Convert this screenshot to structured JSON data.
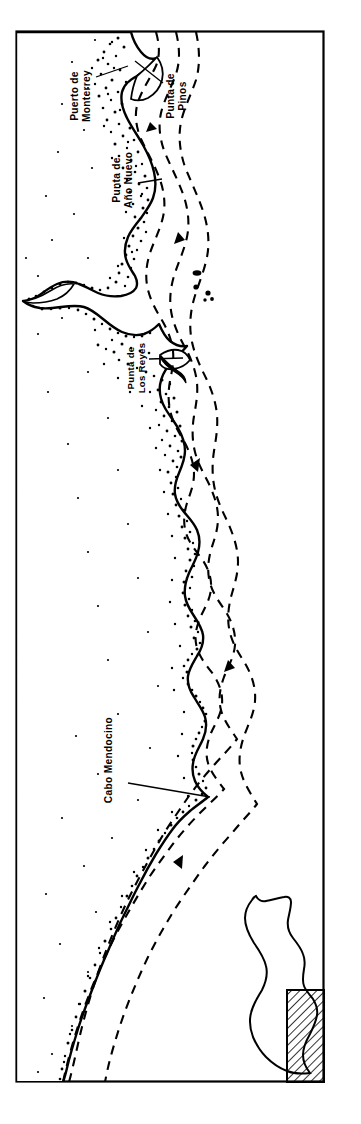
{
  "figure": {
    "type": "map",
    "title": "",
    "orientation": "rotated-90",
    "frame": {
      "visible": true,
      "stroke": "#000000",
      "x": 16,
      "y": 31,
      "width": 308,
      "height": 1051
    }
  },
  "labels": [
    {
      "id": "puerto-de-monterrey",
      "line1": "Puerto de",
      "line2": "Monterrey",
      "x": 78,
      "y": 96,
      "rotation": -90
    },
    {
      "id": "punta-de-pinos",
      "line1": "Punta de",
      "line2": "Pinos",
      "x": 174,
      "y": 96,
      "rotation": -90
    },
    {
      "id": "punta-de-ano-nuevo",
      "line1": "Punta de",
      "line2": "Año Nuevo",
      "x": 120,
      "y": 180,
      "rotation": -90
    },
    {
      "id": "punta-de-los-reyes",
      "line1": "Punta de",
      "line2": "Los Reyes",
      "x": 134,
      "y": 368,
      "rotation": -90
    },
    {
      "id": "cabo-mendocino",
      "line1": "Cabo Mendocino",
      "line2": "",
      "x": 112,
      "y": 760,
      "rotation": -90
    }
  ],
  "leader_lines": [
    {
      "id": "leader-monterrey",
      "from_x": 96,
      "from_y": 77,
      "to_x": 126,
      "to_y": 66
    },
    {
      "id": "leader-pinos",
      "from_x": 163,
      "from_y": 83,
      "to_x": 138,
      "to_y": 62
    },
    {
      "id": "leader-ano-nuevo",
      "from_x": 138,
      "from_y": 183,
      "to_x": 160,
      "to_y": 178
    },
    {
      "id": "leader-los-reyes",
      "from_x": 150,
      "from_y": 359,
      "to_x": 182,
      "to_y": 358
    },
    {
      "id": "leader-mendocino",
      "from_x": 128,
      "from_y": 783,
      "to_x": 208,
      "to_y": 796
    }
  ],
  "currents": {
    "style": "dashed",
    "count": 3,
    "arrow_count": 5,
    "label": "ocean current"
  },
  "islands": {
    "name": "offshore-islands",
    "count": 5
  },
  "inset": {
    "name": "california-locator-inset",
    "outline_label": "California",
    "highlight_label": "study area",
    "hatched": true,
    "x": 238,
    "y": 888,
    "width": 86,
    "height": 194
  },
  "colors": {
    "ink": "#000000",
    "paper": "#ffffff",
    "stipple": "#111111"
  }
}
